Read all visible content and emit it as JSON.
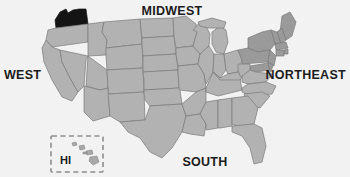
{
  "map": {
    "title": "United States Regions Map",
    "background_color": "#f2f2f2",
    "state_fill_color": "#b2b2b2",
    "state_border_color": "#7a7a7a",
    "northeast_fill_color": "#9a9a9a",
    "highlight_fill_color": "#141414",
    "highlighted_state": "WA",
    "region_labels": [
      {
        "id": "west",
        "text": "WEST"
      },
      {
        "id": "midwest",
        "text": "MIDWEST"
      },
      {
        "id": "northeast",
        "text": "NORTHEAST"
      },
      {
        "id": "south",
        "text": "SOUTH"
      }
    ],
    "inset": {
      "id": "hawaii",
      "label": "HI",
      "border_style": "dashed",
      "border_color": "#8e8e8e"
    }
  }
}
